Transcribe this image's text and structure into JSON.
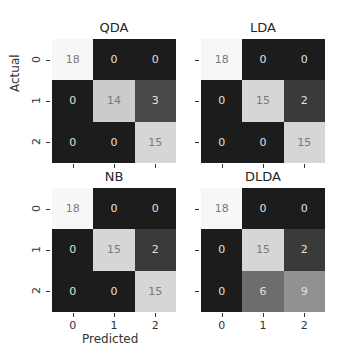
{
  "chart_data": [
    {
      "type": "heatmap",
      "title": "QDA",
      "xlabel": "",
      "ylabel": "Actual",
      "row_labels": [
        "0",
        "1",
        "2"
      ],
      "col_labels": [
        "0",
        "1",
        "2"
      ],
      "values": [
        [
          18,
          0,
          0
        ],
        [
          0,
          14,
          3
        ],
        [
          0,
          0,
          15
        ]
      ]
    },
    {
      "type": "heatmap",
      "title": "LDA",
      "xlabel": "",
      "ylabel": "",
      "row_labels": [
        "0",
        "1",
        "2"
      ],
      "col_labels": [
        "0",
        "1",
        "2"
      ],
      "values": [
        [
          18,
          0,
          0
        ],
        [
          0,
          15,
          2
        ],
        [
          0,
          0,
          15
        ]
      ]
    },
    {
      "type": "heatmap",
      "title": "NB",
      "xlabel": "Predicted",
      "ylabel": "",
      "row_labels": [
        "0",
        "1",
        "2"
      ],
      "col_labels": [
        "0",
        "1",
        "2"
      ],
      "values": [
        [
          18,
          0,
          0
        ],
        [
          0,
          15,
          2
        ],
        [
          0,
          0,
          15
        ]
      ]
    },
    {
      "type": "heatmap",
      "title": "DLDA",
      "xlabel": "",
      "ylabel": "",
      "row_labels": [
        "0",
        "1",
        "2"
      ],
      "col_labels": [
        "0",
        "1",
        "2"
      ],
      "values": [
        [
          18,
          0,
          0
        ],
        [
          0,
          15,
          2
        ],
        [
          0,
          6,
          9
        ]
      ]
    }
  ],
  "labels": {
    "ylabel": "Actual",
    "xlabel": "Predicted"
  },
  "colormap": {
    "min_color": "#1c1c1c",
    "max_color": "#f7f7f7",
    "vmin": 0,
    "vmax": 18
  }
}
